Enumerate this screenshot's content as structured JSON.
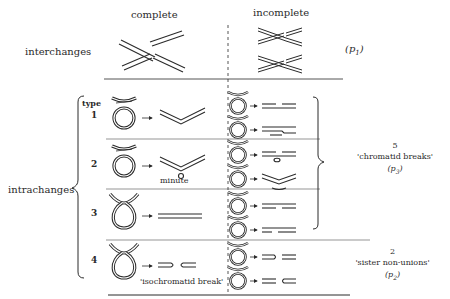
{
  "columns": {
    "complete": "complete",
    "incomplete": "incomplete"
  },
  "rows": {
    "interchanges": {
      "label": "interchanges",
      "probability": "(p",
      "probability_sub": "1",
      "probability_close": ")"
    },
    "intrachanges": {
      "label": "intrachanges",
      "type_header": "type",
      "types": [
        {
          "number": "1"
        },
        {
          "number": "2",
          "annotation": "minute"
        },
        {
          "number": "3"
        },
        {
          "number": "4",
          "annotation": "'isochromatid break'"
        }
      ]
    }
  },
  "groups": {
    "chromatid_breaks": {
      "count": "5",
      "label": "'chromatid breaks'",
      "probability": "(p",
      "probability_sub": "3",
      "probability_close": ")"
    },
    "sister_non_unions": {
      "count": "2",
      "label": "'sister non-unions'",
      "probability": "(p",
      "probability_sub": "2",
      "probability_close": ")"
    }
  },
  "colors": {
    "ink": "#2a2a2a",
    "background": "#ffffff"
  }
}
